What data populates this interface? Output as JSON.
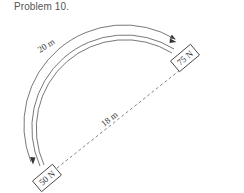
{
  "title": "Problem 10.",
  "arc": {
    "length_label": "20 m"
  },
  "chord": {
    "length_label": "18 m"
  },
  "blocks": [
    {
      "id": "top-right",
      "label": "75 N"
    },
    {
      "id": "bottom-left",
      "label": "50 N"
    }
  ],
  "colors": {
    "line": "#555555",
    "text": "#333333",
    "background": "#ffffff"
  }
}
